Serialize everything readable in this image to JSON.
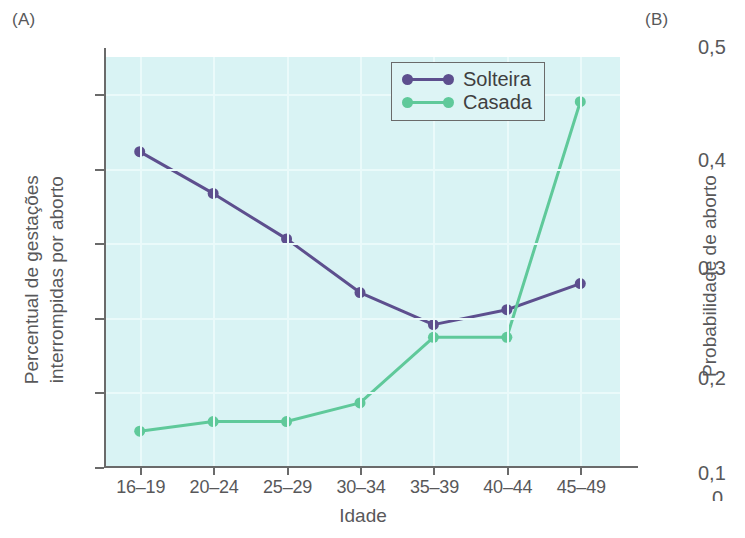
{
  "panels": {
    "a_label": "(A)",
    "b_label": "(B)"
  },
  "chart_data": {
    "type": "line",
    "title": "",
    "xlabel": "Idade",
    "ylabel": "Percentual de gestações interrompidas por aborto",
    "ylabel_line1": "Percentual de gestações",
    "ylabel_line2": "interrompidas por aborto",
    "categories": [
      "16–19",
      "20–24",
      "25–29",
      "30–34",
      "35–39",
      "40–44",
      "45–49"
    ],
    "ylim": [
      0,
      55
    ],
    "yticks": [
      0,
      10,
      20,
      30,
      40,
      50
    ],
    "ytick_labels": [
      "0",
      "10",
      "20",
      "30",
      "40",
      "50"
    ],
    "grid": true,
    "legend_position": "top-right",
    "series": [
      {
        "name": "Solteira",
        "color": "#5d4f8e",
        "values": [
          42.3,
          36.7,
          30.6,
          23.4,
          19.1,
          21.1,
          24.6
        ]
      },
      {
        "name": "Casada",
        "color": "#5fc99a",
        "values": [
          4.8,
          6.1,
          6.1,
          8.6,
          17.4,
          17.4,
          49.0
        ]
      }
    ]
  },
  "panel_b": {
    "ylabel": "Probabilidade de aborto",
    "ytick_labels": [
      "0,5",
      "0,4",
      "0,3",
      "0,2",
      "0,1"
    ],
    "partial_label": "0"
  },
  "colors": {
    "plot_background": "#d9f3f4",
    "gridline": "#eafafa",
    "axis": "#6a6a6a",
    "text": "#58585a",
    "solteira": "#5d4f8e",
    "casada": "#5fc99a"
  }
}
